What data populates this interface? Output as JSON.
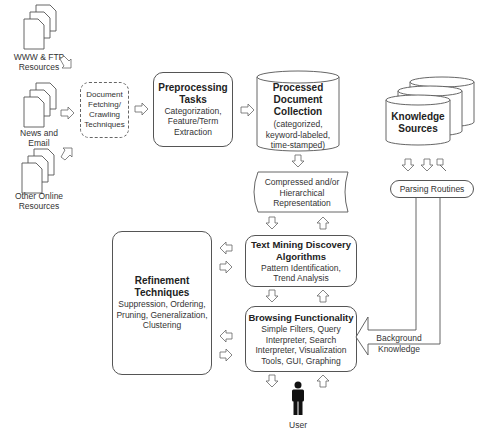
{
  "sources": [
    {
      "label": "WWW & FTP Resources"
    },
    {
      "label": "News and Email"
    },
    {
      "label": "Other Online Resources"
    }
  ],
  "fetching": {
    "label": "Document Fetching/ Crawling Techniques"
  },
  "preprocessing": {
    "title": "Preprocessing Tasks",
    "detail": "Categorization, Feature/Term Extraction"
  },
  "collection": {
    "title": "Processed Document Collection",
    "detail": "(categorized, keyword-labeled, time-stamped)"
  },
  "knowledge": {
    "title": "Knowledge Sources"
  },
  "parsing": {
    "label": "Parsing Routines"
  },
  "representation": {
    "label": "Compressed and/or Hierarchical Representation"
  },
  "discovery": {
    "title": "Text Mining Discovery Algorithms",
    "detail": "Pattern Identification, Trend Analysis"
  },
  "refinement": {
    "title": "Refinement Techniques",
    "detail": "Suppression, Ordering, Pruning, Generalization, Clustering"
  },
  "browsing": {
    "title": "Browsing Functionality",
    "detail": "Simple Filters, Query Interpreter, Search Interpreter, Visualization Tools, GUI, Graphing"
  },
  "background": {
    "label": "Background Knowledge"
  },
  "user": {
    "label": "User"
  },
  "colors": {
    "stroke": "#555555",
    "fill": "#ffffff",
    "user": "#111111"
  }
}
